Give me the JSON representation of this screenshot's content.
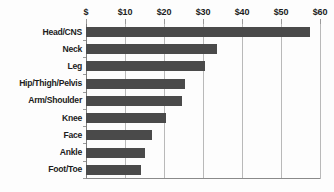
{
  "chart_data": {
    "type": "bar",
    "orientation": "horizontal",
    "title": "",
    "subtitle": "",
    "xlabel": "",
    "ylabel": "",
    "categories": [
      "Head/CNS",
      "Neck",
      "Leg",
      "Hip/Thigh/Pelvis",
      "Arm/Shoulder",
      "Knee",
      "Face",
      "Ankle",
      "Foot/Toe"
    ],
    "values": [
      57.5,
      33.5,
      30.5,
      25.5,
      24.5,
      20.5,
      17.0,
      15.0,
      14.0
    ],
    "xlim": [
      0,
      60
    ],
    "ylim": null,
    "x_ticks": [
      0,
      10,
      20,
      30,
      40,
      50,
      60
    ],
    "x_tick_labels": [
      "$",
      "$10",
      "$20",
      "$30",
      "$40",
      "$50",
      "$60"
    ],
    "grid": true,
    "grid_axis": "x",
    "legend": false,
    "legend_position": "none",
    "axis_label_position": "top",
    "bar_color": "#4a4a4a",
    "gridline_color": "#b9b9b9",
    "background_color": "#fdfdfd",
    "text_color": "#1c1c1c",
    "annotations": []
  }
}
